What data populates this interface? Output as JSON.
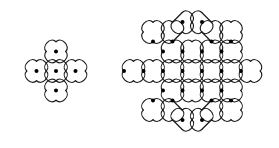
{
  "figure": {
    "background_color": "#ffffff",
    "line_color": "#1a1a1a",
    "dot_color": "#000000",
    "line_width": 1.15,
    "dot_radius": 2.0,
    "canvas": {
      "width": 279,
      "height": 148
    }
  },
  "patterns": [
    {
      "id": "small-kolam",
      "name": "Five dot cross kolam",
      "dot_count": 5,
      "row_counts": [
        1,
        3,
        1
      ],
      "center": {
        "x": 56,
        "y": 71
      },
      "spacing": 19.5,
      "grid_rotation_deg": 45,
      "dots": [
        {
          "x": 56,
          "y": 51.5
        },
        {
          "x": 36.5,
          "y": 71
        },
        {
          "x": 56,
          "y": 71
        },
        {
          "x": 75.5,
          "y": 71
        },
        {
          "x": 56,
          "y": 90.5
        }
      ]
    },
    {
      "id": "large-kolam",
      "name": "Twenty-five dot diamond kolam",
      "dot_count": 25,
      "row_counts": [
        2,
        4,
        5,
        7,
        5,
        4,
        2
      ],
      "center": {
        "x": 192,
        "y": 71
      },
      "spacing": 19.5,
      "grid_rotation_deg": 45,
      "dots": [
        {
          "x": 182.5,
          "y": 22
        },
        {
          "x": 202,
          "y": 22
        },
        {
          "x": 153,
          "y": 41.5
        },
        {
          "x": 172.5,
          "y": 41.5
        },
        {
          "x": 211.5,
          "y": 41.5
        },
        {
          "x": 231,
          "y": 41.5
        },
        {
          "x": 163,
          "y": 51.5
        },
        {
          "x": 182.5,
          "y": 51.5
        },
        {
          "x": 202,
          "y": 51.5
        },
        {
          "x": 221.5,
          "y": 51.5
        },
        {
          "x": 124,
          "y": 71
        },
        {
          "x": 143.5,
          "y": 71
        },
        {
          "x": 163,
          "y": 71
        },
        {
          "x": 182.5,
          "y": 71
        },
        {
          "x": 202,
          "y": 71
        },
        {
          "x": 221.5,
          "y": 71
        },
        {
          "x": 241,
          "y": 71
        },
        {
          "x": 163,
          "y": 90.5
        },
        {
          "x": 182.5,
          "y": 90.5
        },
        {
          "x": 202,
          "y": 90.5
        },
        {
          "x": 221.5,
          "y": 90.5
        },
        {
          "x": 153,
          "y": 100.5
        },
        {
          "x": 172.5,
          "y": 100.5
        },
        {
          "x": 211.5,
          "y": 100.5
        },
        {
          "x": 231,
          "y": 100.5
        },
        {
          "x": 182.5,
          "y": 120
        },
        {
          "x": 202,
          "y": 120
        }
      ]
    }
  ]
}
